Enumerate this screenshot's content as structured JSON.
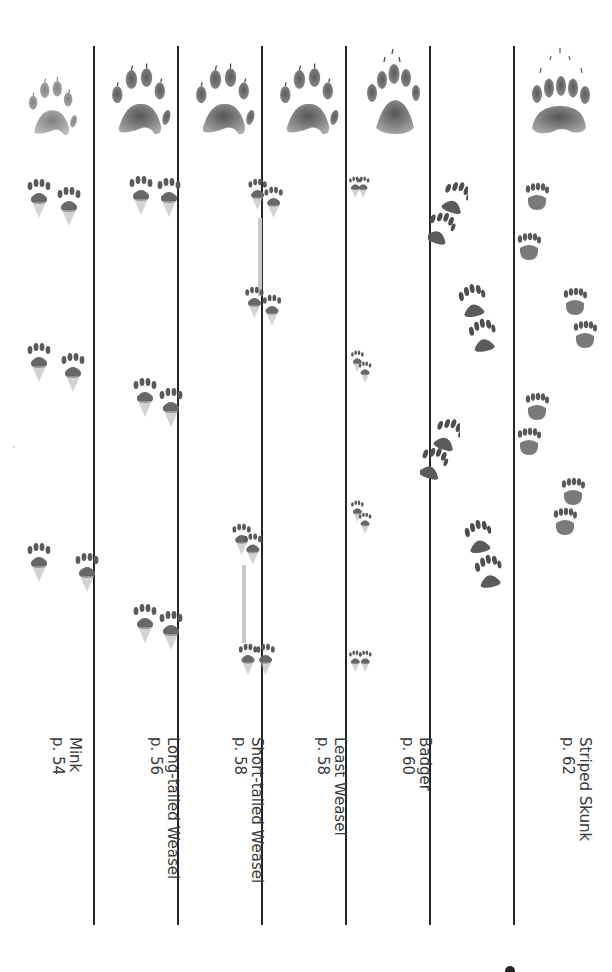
{
  "page": {
    "layout": "rotated field-guide plate: track comparison columns",
    "text_orientation": "rotated 90deg clockwise",
    "colors": {
      "ink": "#262626",
      "print": "#6b6b6b",
      "background": "#ffffff"
    }
  },
  "columns": [
    {
      "id": "mink",
      "name": "Mink",
      "page_ref": "p. 54",
      "foot_icon": "mink-foot-icon",
      "tracks": [
        "paired-prints-1",
        "paired-prints-2",
        "paired-prints-3"
      ]
    },
    {
      "id": "long-tailed-weasel",
      "name": "Long-tailed Weasel",
      "page_ref": "p. 56",
      "foot_icon": "long-tailed-weasel-foot-icon",
      "tracks": [
        "paired-prints-1",
        "paired-prints-2",
        "paired-prints-3"
      ]
    },
    {
      "id": "short-tailed-weasel",
      "name": "Short-tailed Weasel",
      "page_ref": "p. 58",
      "foot_icon": "short-tailed-weasel-foot-icon",
      "tracks": [
        "paired-prints-1",
        "paired-prints-2",
        "paired-prints-3",
        "paired-prints-4"
      ]
    },
    {
      "id": "least-weasel",
      "name": "Least Weasel",
      "page_ref": "p. 58",
      "foot_icon": "least-weasel-foot-icon",
      "tracks": [
        "paired-prints-1",
        "paired-prints-2",
        "paired-prints-3",
        "paired-prints-4"
      ]
    },
    {
      "id": "badger",
      "name": "Badger",
      "page_ref": "p. 60",
      "foot_icon": "badger-foot-icon",
      "tracks": [
        "overlap-prints-1",
        "overlap-prints-2",
        "overlap-prints-3",
        "overlap-prints-4"
      ]
    },
    {
      "id": "striped-skunk",
      "name": "Striped Skunk",
      "page_ref": "p. 62",
      "foot_icon": "striped-skunk-foot-icon",
      "tracks": [
        "prints-1",
        "prints-2",
        "prints-3",
        "prints-4",
        "prints-5",
        "prints-6",
        "prints-7",
        "prints-8"
      ]
    }
  ]
}
